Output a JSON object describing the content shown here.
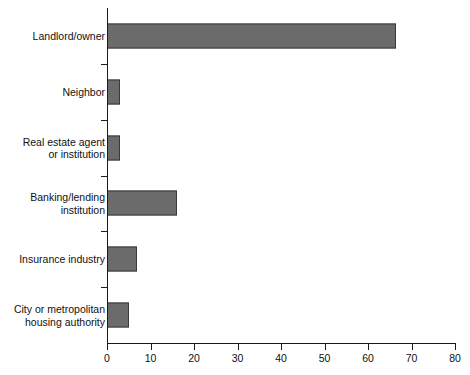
{
  "chart_data": {
    "type": "bar",
    "orientation": "horizontal",
    "title": "",
    "subtitle": "",
    "xlabel": "",
    "ylabel": "",
    "categories": [
      "Landlord/owner",
      "Neighbor",
      "Real estate agent\nor institution",
      "Banking/lending\ninstitution",
      "Insurance industry",
      "City or metropolitan\nhousing authority"
    ],
    "values": [
      66.5,
      3,
      3,
      16,
      7,
      5
    ],
    "xlim": [
      0,
      80
    ],
    "xticks": [
      0,
      10,
      20,
      30,
      40,
      50,
      60,
      70,
      80
    ],
    "xtick_labels": [
      "0",
      "10",
      "20",
      "30",
      "40",
      "50",
      "60",
      "70",
      "80"
    ],
    "grid": false,
    "legend": false,
    "bar_color": "#6b6b6b",
    "bar_edge_color": "#3a3a3a",
    "axis_color": "#1a1a1a"
  }
}
